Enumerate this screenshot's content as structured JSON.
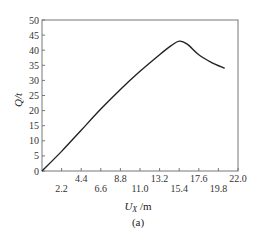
{
  "chart_data": {
    "type": "line",
    "title": "",
    "caption": "(a)",
    "xlabel": "U_X /m",
    "ylabel": "Q/t",
    "xlim": [
      0,
      22.0
    ],
    "ylim": [
      0,
      50
    ],
    "x_ticks_upper": [
      "4.4",
      "8.8",
      "13.2",
      "17.6",
      "22.0"
    ],
    "x_ticks_lower": [
      "2.2",
      "6.6",
      "11.0",
      "15.4",
      "19.8"
    ],
    "y_ticks": [
      "0",
      "5",
      "10",
      "15",
      "20",
      "25",
      "30",
      "35",
      "40",
      "45",
      "50"
    ],
    "grid": false,
    "series": [
      {
        "name": "Q",
        "x": [
          0,
          2.2,
          4.4,
          6.6,
          8.8,
          11.0,
          13.2,
          14.5,
          15.4,
          16.3,
          17.6,
          19.0,
          20.5
        ],
        "y": [
          0,
          6.5,
          13.5,
          20.5,
          27,
          33,
          38.5,
          41.5,
          43,
          42,
          38.5,
          36,
          34
        ]
      }
    ]
  },
  "labels": {
    "ylabel_text": "Q/t",
    "xlabel_main": "U",
    "xlabel_sub": "X",
    "xlabel_unit": " /m",
    "caption": "(a)"
  }
}
